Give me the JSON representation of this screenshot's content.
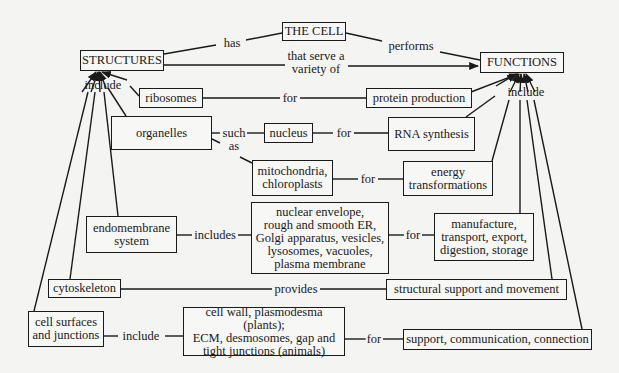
{
  "diagram": {
    "type": "concept-map",
    "nodes": {
      "the_cell": "THE CELL",
      "structures": "STRUCTURES",
      "functions": "FUNCTIONS",
      "ribosomes": "ribosomes",
      "protein_production": "protein production",
      "organelles": "organelles",
      "nucleus": "nucleus",
      "rna_synthesis": "RNA synthesis",
      "mito_chloro": "mitochondria,\nchloroplasts",
      "energy": "energy\ntransformations",
      "endomembrane": "endomembrane\nsystem",
      "endomembrane_parts": "nuclear envelope,\nrough and smooth ER,\nGolgi apparatus, vesicles,\nlysosomes, vacuoles,\nplasma membrane",
      "manufacture": "manufacture,\ntransport, export,\ndigestion, storage",
      "cytoskeleton": "cytoskeleton",
      "structural_support": "structural support and movement",
      "cell_surfaces": "cell surfaces\nand junctions",
      "cell_surface_parts": "cell wall, plasmodesma (plants);\nECM, desmosomes, gap and\ntight junctions (animals)",
      "support_comm": "support, communication, connection"
    },
    "links": {
      "has": "has",
      "performs": "performs",
      "serve_variety": "that serve a\nvariety of",
      "include_structures": "include",
      "include_functions": "include",
      "for_ribosomes": "for",
      "such_as": "such\nas",
      "for_nucleus": "for",
      "for_mito": "for",
      "includes_endo": "includes",
      "for_endo": "for",
      "provides": "provides",
      "include_surfaces": "include",
      "for_surfaces": "for"
    },
    "colors": {
      "background": "#f4f4f2",
      "ink": "#1a1a1a"
    }
  }
}
